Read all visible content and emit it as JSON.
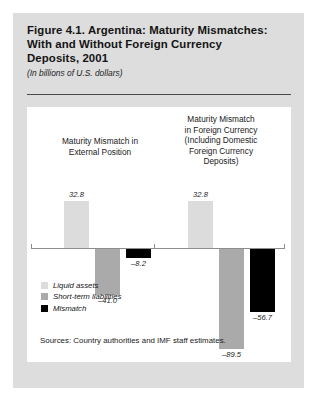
{
  "figure": {
    "title_lines": [
      "Figure 4.1. Argentina: Maturity Mismatches:",
      "With and Without Foreign Currency",
      "Deposits, 2001"
    ],
    "subtitle": "(In billions of U.S. dollars)",
    "source_note": "Sources: Country authorities and IMF staff estimates."
  },
  "colors": {
    "panel_background": "#dddddd",
    "card_background": "#ffffff",
    "liquid_assets": "#dcdcdc",
    "short_term_liabilities": "#aaaaaa",
    "mismatch": "#000000",
    "axis": "#8d8d8d",
    "rule": "#4a4a4a",
    "text": "#1a1a1a"
  },
  "chart_data": {
    "type": "bar",
    "title": "Figure 4.1. Argentina: Maturity Mismatches: With and Without Foreign Currency Deposits, 2001",
    "subtitle": "(In billions of U.S. dollars)",
    "xlabel": "",
    "ylabel": "",
    "ylim": [
      -95,
      40
    ],
    "grid": false,
    "legend_position": "inside-bottom-left",
    "categories": [
      "Maturity Mismatch in External Position",
      "Maturity Mismatch in Foreign Currency (Including Domestic Foreign Currency Deposits)"
    ],
    "category_caption_lines": [
      [
        "Maturity Mismatch in",
        "External Position"
      ],
      [
        "Maturity Mismatch",
        "in Foreign Currency",
        "(Including Domestic",
        "Foreign Currency",
        "Deposits)"
      ]
    ],
    "series": [
      {
        "name": "Liquid assets",
        "color": "#dcdcdc",
        "values": [
          32.8,
          32.8
        ]
      },
      {
        "name": "Short-term liabilities",
        "color": "#aaaaaa",
        "values": [
          -41.0,
          -89.5
        ]
      },
      {
        "name": "Mismatch",
        "color": "#000000",
        "values": [
          -8.2,
          -56.7
        ]
      }
    ],
    "point_labels": [
      {
        "group": 0,
        "series": "Liquid assets",
        "text": "32.8"
      },
      {
        "group": 0,
        "series": "Short-term liabilities",
        "text": "–41.0"
      },
      {
        "group": 0,
        "series": "Mismatch",
        "text": "–8.2"
      },
      {
        "group": 1,
        "series": "Liquid assets",
        "text": "32.8"
      },
      {
        "group": 1,
        "series": "Short-term liabilities",
        "text": "–89.5"
      },
      {
        "group": 1,
        "series": "Mismatch",
        "text": "–56.7"
      }
    ]
  },
  "legend": {
    "items": [
      {
        "label": "Liquid assets",
        "swatch": "liquid"
      },
      {
        "label": "Short-term liabilities",
        "swatch": "stliab"
      },
      {
        "label": "Mismatch",
        "swatch": "mismatch"
      }
    ]
  }
}
